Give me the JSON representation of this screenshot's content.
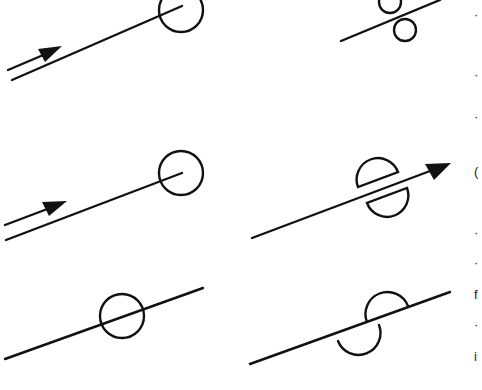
{
  "diagram": {
    "type": "symbol-sheet",
    "stroke_color": "#111111",
    "background": "#ffffff",
    "symbols": [
      {
        "id": "top-left",
        "description": "line terminating in circle with parallel flow arrow"
      },
      {
        "id": "top-right",
        "description": "line with two offset small circles"
      },
      {
        "id": "middle-left",
        "description": "line terminating in circle with parallel flow arrow"
      },
      {
        "id": "middle-right",
        "description": "arrowed line passing between two split semicircles"
      },
      {
        "id": "bottom-left",
        "description": "line passing through a circle"
      },
      {
        "id": "bottom-right",
        "description": "line with opposing semicircle arcs"
      }
    ],
    "edge_fragments": [
      "·",
      "·",
      "·",
      "(",
      "·",
      "·",
      "f",
      "·",
      "i"
    ]
  }
}
